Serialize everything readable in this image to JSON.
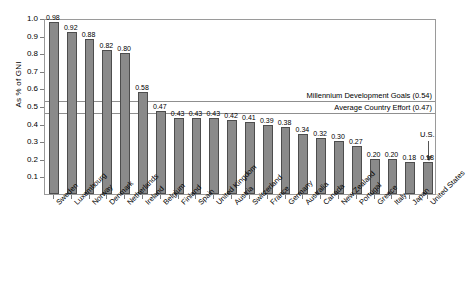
{
  "chart_data": {
    "type": "bar",
    "title": "",
    "xlabel": "",
    "ylabel": "As % of GNI",
    "ylim": [
      0.0,
      1.0
    ],
    "ytick_labels": [
      "1.0",
      "0.9",
      "0.8",
      "0.7",
      "0.6",
      "0.5",
      "0.4",
      "0.3",
      "0.2",
      "0.1"
    ],
    "ytick_values": [
      1.0,
      0.9,
      0.8,
      0.7,
      0.6,
      0.5,
      0.4,
      0.3,
      0.2,
      0.1
    ],
    "grid": false,
    "legend": "none",
    "categories": [
      "Sweden",
      "Luxembourg",
      "Norway",
      "Denmark",
      "Netherlands",
      "Ireland",
      "Belgium",
      "Finland",
      "Spain",
      "United Kingdom",
      "Austria",
      "Switzerland",
      "France",
      "Germany",
      "Australia",
      "Canada",
      "New Zealand",
      "Portugal",
      "Greece",
      "Italy",
      "Japan",
      "United States"
    ],
    "values": [
      0.98,
      0.92,
      0.88,
      0.82,
      0.8,
      0.58,
      0.47,
      0.43,
      0.43,
      0.43,
      0.42,
      0.41,
      0.39,
      0.38,
      0.34,
      0.32,
      0.3,
      0.27,
      0.2,
      0.2,
      0.18,
      0.18
    ],
    "value_labels": [
      "0.98",
      "0.92",
      "0.88",
      "0.82",
      "0.80",
      "0.58",
      "0.47",
      "0.43",
      "0.43",
      "0.43",
      "0.42",
      "0.41",
      "0.39",
      "0.38",
      "0.34",
      "0.32",
      "0.30",
      "0.27",
      "0.20",
      "0.20",
      "0.18",
      "0.18"
    ],
    "reference_lines": [
      {
        "label": "Millennium Development Goals (0.54)",
        "value": 0.54
      },
      {
        "label": "Average Country Effort (0.47)",
        "value": 0.47
      }
    ],
    "annotations": [
      {
        "label": "U.S.",
        "target_category": "United States",
        "target_value": 0.18
      }
    ]
  }
}
